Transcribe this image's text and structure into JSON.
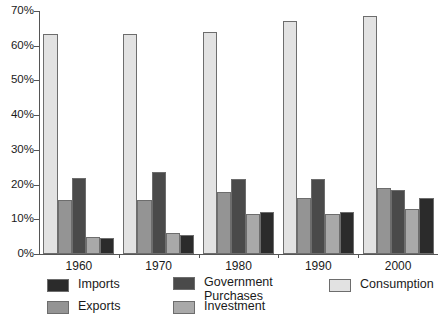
{
  "chart_data": {
    "type": "bar",
    "title": "",
    "xlabel": "",
    "ylabel": "",
    "ylim": [
      0,
      70
    ],
    "ytick_labels": [
      "0%",
      "10%",
      "20%",
      "30%",
      "40%",
      "50%",
      "60%",
      "70%"
    ],
    "ytick_values": [
      0,
      10,
      20,
      30,
      40,
      50,
      60,
      70
    ],
    "grid": false,
    "legend_position": "bottom",
    "categories": [
      "1960",
      "1970",
      "1980",
      "1990",
      "2000"
    ],
    "series": [
      {
        "name": "Consumption",
        "color": "#e2e2e2",
        "values": [
          63.5,
          63.3,
          64.0,
          67.0,
          68.7
        ]
      },
      {
        "name": "Exports",
        "color": "#949494",
        "values": [
          15.5,
          15.5,
          18.0,
          16.0,
          19.0
        ]
      },
      {
        "name": "Government Purchases",
        "color": "#4a4a4a",
        "values": [
          22.0,
          23.5,
          21.5,
          21.5,
          18.5
        ]
      },
      {
        "name": "Investment",
        "color": "#a9a9a9",
        "values": [
          5.0,
          6.0,
          11.5,
          11.5,
          13.0
        ]
      },
      {
        "name": "Imports",
        "color": "#2b2b2b",
        "values": [
          4.5,
          5.5,
          12.0,
          12.0,
          16.0
        ]
      }
    ]
  },
  "legend": {
    "entries": [
      {
        "label": "Imports",
        "color": "#2b2b2b"
      },
      {
        "label": "Exports",
        "color": "#949494"
      },
      {
        "label": "Government\nPurchases",
        "color": "#4a4a4a"
      },
      {
        "label": "Investment",
        "color": "#a9a9a9"
      },
      {
        "label": "Consumption",
        "color": "#e2e2e2"
      }
    ]
  }
}
